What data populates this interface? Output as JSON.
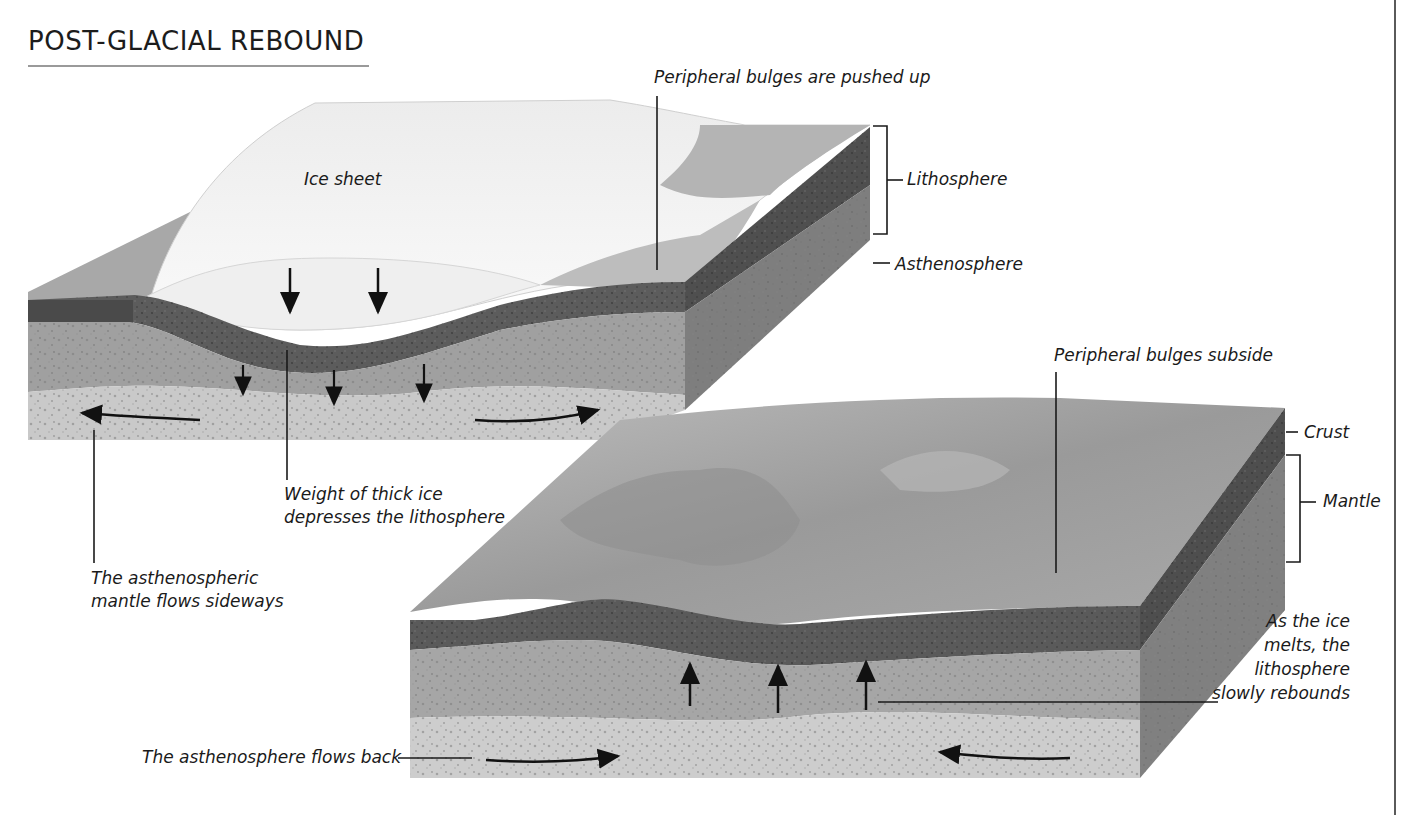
{
  "title": "POST-GLACIAL REBOUND",
  "panels": {
    "top": {
      "name": "Glaciated state",
      "labels": {
        "ice_sheet": "Ice sheet",
        "bulges_up": "Peripheral bulges are pushed up",
        "lithosphere": "Lithosphere",
        "asthenosphere": "Asthenosphere",
        "weight_line1": "Weight of thick ice",
        "weight_line2": "depresses the lithosphere",
        "sideways_line1": "The asthenospheric",
        "sideways_line2": "mantle flows sideways"
      },
      "arrows": {
        "down_on_ice": 2,
        "down_in_mantle": 3,
        "sideways_flow": 2
      }
    },
    "bottom": {
      "name": "Post-glacial state",
      "labels": {
        "bulges_subside": "Peripheral bulges subside",
        "crust": "Crust",
        "mantle": "Mantle",
        "rebound_line1": "As the ice",
        "rebound_line2": "melts, the",
        "rebound_line3": "lithosphere",
        "rebound_line4": "slowly rebounds",
        "flows_back": "The asthenosphere flows back"
      },
      "arrows": {
        "up_rebound": 3,
        "inward_flow": 2
      }
    }
  },
  "colors": {
    "ice": "#f4f4f4",
    "lithosphere_dark": "#5e5e5e",
    "mantle_mid": "#a3a3a3",
    "asthenosphere_light": "#c8c8c8",
    "surface_grey": "#9c9c9c",
    "side_face": "#7d7d7d",
    "leader_line": "#1a1a1a"
  }
}
